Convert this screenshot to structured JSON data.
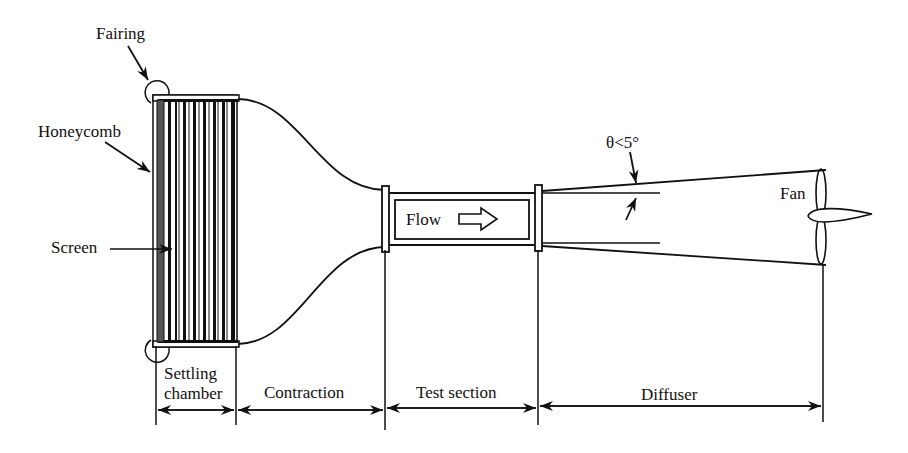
{
  "figure": {
    "type": "wind-tunnel-schematic",
    "labels": {
      "fairing": "Fairing",
      "honeycomb": "Honeycomb",
      "screen": "Screen",
      "flow": "Flow",
      "angle": "θ<5°",
      "fan": "Fan"
    },
    "sections": [
      {
        "label_line1": "Settling",
        "label_line2": "chamber"
      },
      {
        "label": "Contraction"
      },
      {
        "label": "Test section"
      },
      {
        "label": "Diffuser"
      }
    ],
    "colors": {
      "line": "#111111",
      "background": "#ffffff"
    }
  }
}
